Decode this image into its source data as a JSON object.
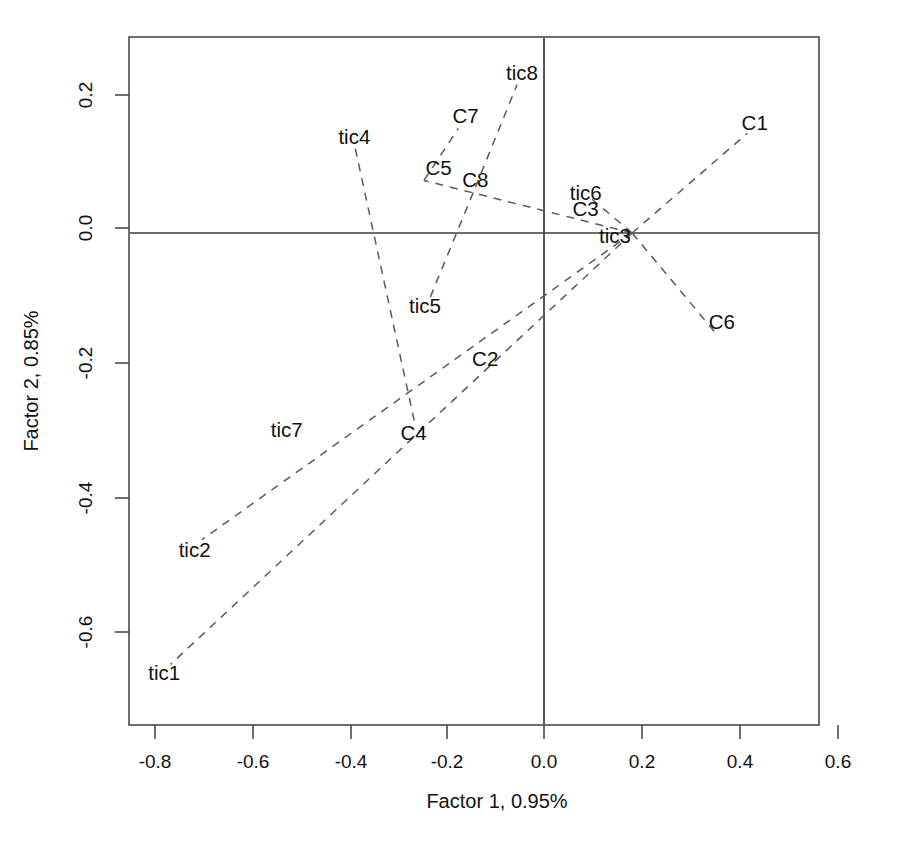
{
  "chart_data": {
    "type": "scatter",
    "title": "",
    "subtitle": "",
    "xlabel": "Factor 1, 0.95%",
    "ylabel": "Factor 2, 0.85%",
    "xlim": [
      -0.87,
      0.66
    ],
    "ylim": [
      -0.7,
      0.28
    ],
    "xticks": [
      -0.8,
      -0.6,
      -0.4,
      -0.2,
      0.0,
      0.2,
      0.4,
      0.6
    ],
    "xticklabels": [
      "-0.8",
      "-0.6",
      "-0.4",
      "-0.2",
      "0.0",
      "0.2",
      "0.4",
      "0.6"
    ],
    "yticks": [
      -0.6,
      -0.4,
      -0.2,
      0.0,
      0.2
    ],
    "yticklabels": [
      "-0.6",
      "-0.4",
      "-0.2",
      "0.0",
      "0.2"
    ],
    "grid": false,
    "legend": "none",
    "reference_lines": [
      {
        "name": "horizontal-zero-line",
        "orientation": "horizontal",
        "value": 0.0
      },
      {
        "name": "vertical-zero-line",
        "orientation": "vertical",
        "value": 0.0
      }
    ],
    "origin_point": {
      "x": 0.18,
      "y": 0.0
    },
    "points": [
      {
        "label": "C1",
        "x": 0.43,
        "y": 0.163
      },
      {
        "label": "C2",
        "x": -0.12,
        "y": -0.187
      },
      {
        "label": "C3",
        "x": 0.085,
        "y": 0.035
      },
      {
        "label": "C4",
        "x": -0.266,
        "y": -0.296
      },
      {
        "label": "C5",
        "x": -0.215,
        "y": 0.096
      },
      {
        "label": "C6",
        "x": 0.363,
        "y": -0.132
      },
      {
        "label": "C7",
        "x": -0.16,
        "y": 0.173
      },
      {
        "label": "C8",
        "x": -0.14,
        "y": 0.078
      },
      {
        "label": "tic1",
        "x": -0.775,
        "y": -0.653
      },
      {
        "label": "tic2",
        "x": -0.713,
        "y": -0.47
      },
      {
        "label": "tic3",
        "x": 0.145,
        "y": -0.005
      },
      {
        "label": "tic4",
        "x": -0.387,
        "y": 0.143
      },
      {
        "label": "tic5",
        "x": -0.243,
        "y": -0.108
      },
      {
        "label": "tic6",
        "x": 0.085,
        "y": 0.06
      },
      {
        "label": "tic7",
        "x": -0.525,
        "y": -0.292
      },
      {
        "label": "tic8",
        "x": -0.045,
        "y": 0.238
      }
    ],
    "vectors": [
      {
        "name": "vector-C1",
        "from": [
          0.18,
          0.0
        ],
        "to": [
          0.415,
          0.148
        ]
      },
      {
        "name": "vector-C6",
        "from": [
          0.18,
          0.0
        ],
        "to": [
          0.352,
          -0.15
        ]
      },
      {
        "name": "vector-C3-tic6",
        "from": [
          0.18,
          0.0
        ],
        "to": [
          0.098,
          0.05
        ]
      },
      {
        "name": "vector-C5-tic4",
        "from": [
          0.18,
          0.0
        ],
        "to": [
          -0.245,
          0.078
        ]
      },
      {
        "name": "vector-C7-tic4",
        "from": [
          -0.385,
          0.125
        ],
        "to": [
          -0.262,
          -0.288
        ]
      },
      {
        "name": "vector-C7-upper",
        "from": [
          -0.245,
          0.078
        ],
        "to": [
          -0.175,
          0.155
        ]
      },
      {
        "name": "vector-C8-tic8",
        "from": [
          -0.14,
          0.068
        ],
        "to": [
          -0.055,
          0.22
        ]
      },
      {
        "name": "vector-tic5-C8",
        "from": [
          -0.232,
          -0.095
        ],
        "to": [
          -0.14,
          0.068
        ]
      },
      {
        "name": "vector-C2-tic2",
        "from": [
          0.18,
          0.0
        ],
        "to": [
          -0.698,
          -0.455
        ]
      },
      {
        "name": "vector-C4-tic1",
        "from": [
          0.18,
          0.0
        ],
        "to": [
          -0.762,
          -0.64
        ]
      }
    ]
  },
  "axes": {
    "x_title": "Factor 1, 0.95%",
    "y_title": "Factor 2, 0.85%"
  }
}
